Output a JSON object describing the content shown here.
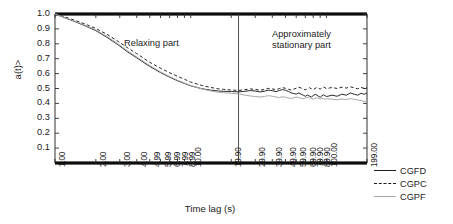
{
  "chart_data": {
    "type": "line",
    "title": "",
    "xlabel": "Time lag (s)",
    "ylabel_html": "<q<sub>a</sub>(t)>",
    "ylabel": "<qa(t)>",
    "xscale": "log",
    "xlim": [
      1.0,
      199.0
    ],
    "ylim": [
      0.0,
      1.0
    ],
    "grid": false,
    "legend_position": "right",
    "xticklabels": [
      "1.00",
      "2.00",
      "3.00",
      "4.00",
      "4.99",
      "5.99",
      "6.99",
      "7.99",
      "8.99",
      "10.00",
      "19.90",
      "29.90",
      "39.90",
      "49.90",
      "59.90",
      "69.90",
      "79.90",
      "89.90",
      "100.00",
      "199.00"
    ],
    "xtickvalues": [
      1.0,
      2.0,
      3.0,
      4.0,
      4.99,
      5.99,
      6.99,
      7.99,
      8.99,
      10.0,
      19.9,
      29.9,
      39.9,
      49.9,
      59.9,
      69.9,
      79.9,
      89.9,
      100.0,
      199.0
    ],
    "yticklabels": [
      "1.0",
      "0.9",
      "0.8",
      "0.7",
      "0.6",
      "0.5",
      "0.4",
      "0.3",
      "0.2",
      "0.1"
    ],
    "ytickvalues": [
      1.0,
      0.9,
      0.8,
      0.7,
      0.6,
      0.5,
      0.4,
      0.3,
      0.2,
      0.1
    ],
    "annotations": [
      {
        "name": "relaxing-part",
        "text": "Relaxing part",
        "x": 3.3,
        "y": 0.8
      },
      {
        "name": "stationary-part",
        "text": "Approximately\nstationary part",
        "x": 45.0,
        "y": 0.85
      }
    ],
    "divider_line": {
      "x": 22.5,
      "orientation": "vertical"
    },
    "colors": {
      "cgfd": "#1f1f1f",
      "cgpc": "#1a1a1a",
      "cgpf": "#a8a8a8",
      "axis": "#000000"
    },
    "series": [
      {
        "name": "CGFD",
        "style": "solid",
        "color": "#1f1f1f",
        "x": [
          1.0,
          1.2,
          1.45,
          1.75,
          2.0,
          2.4,
          2.9,
          3.4,
          4.0,
          4.99,
          5.99,
          6.99,
          7.99,
          8.99,
          10.0,
          12.0,
          14.0,
          16.0,
          17.5,
          19.9,
          22.5,
          25.0,
          27.5,
          29.9,
          32.5,
          35.0,
          37.5,
          39.9,
          42.5,
          45.0,
          47.5,
          49.9,
          52.5,
          55.0,
          57.5,
          59.9,
          62.5,
          65.0,
          67.5,
          69.9,
          72.5,
          75.0,
          77.5,
          79.9,
          82.5,
          85.0,
          87.5,
          89.9,
          92.5,
          95.0,
          97.5,
          100.0,
          110.0,
          120.0,
          130.0,
          140.0,
          150.0,
          160.0,
          170.0,
          180.0,
          190.0,
          199.0
        ],
        "y": [
          1.0,
          0.972,
          0.944,
          0.912,
          0.888,
          0.845,
          0.795,
          0.748,
          0.706,
          0.648,
          0.607,
          0.576,
          0.552,
          0.534,
          0.518,
          0.499,
          0.489,
          0.483,
          0.481,
          0.48,
          0.477,
          0.481,
          0.486,
          0.483,
          0.477,
          0.482,
          0.489,
          0.485,
          0.479,
          0.487,
          0.493,
          0.488,
          0.48,
          0.471,
          0.466,
          0.462,
          0.47,
          0.462,
          0.455,
          0.448,
          0.456,
          0.449,
          0.443,
          0.452,
          0.461,
          0.455,
          0.448,
          0.441,
          0.45,
          0.458,
          0.452,
          0.446,
          0.455,
          0.448,
          0.462,
          0.455,
          0.47,
          0.462,
          0.455,
          0.468,
          0.461,
          0.47
        ]
      },
      {
        "name": "CGPC",
        "style": "dashed",
        "color": "#1a1a1a",
        "x": [
          1.0,
          1.2,
          1.45,
          1.75,
          2.0,
          2.4,
          2.9,
          3.4,
          4.0,
          4.99,
          5.99,
          6.99,
          7.99,
          8.99,
          10.0,
          12.0,
          14.0,
          16.0,
          17.5,
          19.9,
          22.5,
          25.0,
          27.5,
          29.9,
          32.5,
          35.0,
          37.5,
          39.9,
          42.5,
          45.0,
          47.5,
          49.9,
          52.5,
          55.0,
          57.5,
          59.9,
          62.5,
          65.0,
          67.5,
          69.9,
          72.5,
          75.0,
          77.5,
          79.9,
          82.5,
          85.0,
          87.5,
          89.9,
          92.5,
          95.0,
          97.5,
          100.0,
          110.0,
          120.0,
          130.0,
          140.0,
          150.0,
          160.0,
          170.0,
          180.0,
          190.0,
          199.0
        ],
        "y": [
          1.0,
          0.978,
          0.953,
          0.925,
          0.903,
          0.865,
          0.818,
          0.775,
          0.734,
          0.676,
          0.636,
          0.606,
          0.582,
          0.562,
          0.543,
          0.521,
          0.507,
          0.498,
          0.494,
          0.49,
          0.487,
          0.492,
          0.497,
          0.494,
          0.488,
          0.494,
          0.501,
          0.497,
          0.492,
          0.5,
          0.506,
          0.501,
          0.495,
          0.489,
          0.496,
          0.502,
          0.509,
          0.503,
          0.497,
          0.491,
          0.499,
          0.505,
          0.498,
          0.492,
          0.5,
          0.507,
          0.502,
          0.496,
          0.503,
          0.51,
          0.505,
          0.499,
          0.507,
          0.5,
          0.509,
          0.503,
          0.511,
          0.505,
          0.498,
          0.507,
          0.501,
          0.508
        ]
      },
      {
        "name": "CGPF",
        "style": "solid",
        "color": "#a8a8a8",
        "x": [
          1.0,
          1.2,
          1.45,
          1.75,
          2.0,
          2.4,
          2.9,
          3.4,
          4.0,
          4.99,
          5.99,
          6.99,
          7.99,
          8.99,
          10.0,
          12.0,
          14.0,
          16.0,
          17.5,
          19.9,
          22.5,
          25.0,
          27.5,
          29.9,
          32.5,
          35.0,
          37.5,
          39.9,
          42.5,
          45.0,
          47.5,
          49.9,
          52.5,
          55.0,
          57.5,
          59.9,
          62.5,
          65.0,
          67.5,
          69.9,
          72.5,
          75.0,
          77.5,
          79.9,
          82.5,
          85.0,
          87.5,
          89.9,
          92.5,
          95.0,
          97.5,
          100.0,
          110.0,
          120.0,
          130.0,
          140.0,
          150.0,
          160.0,
          170.0,
          180.0,
          190.0,
          199.0
        ],
        "y": [
          1.0,
          0.973,
          0.947,
          0.916,
          0.893,
          0.851,
          0.801,
          0.754,
          0.712,
          0.654,
          0.612,
          0.58,
          0.556,
          0.537,
          0.52,
          0.498,
          0.484,
          0.475,
          0.471,
          0.468,
          0.463,
          0.456,
          0.45,
          0.446,
          0.443,
          0.447,
          0.452,
          0.448,
          0.443,
          0.439,
          0.445,
          0.441,
          0.437,
          0.433,
          0.438,
          0.443,
          0.439,
          0.435,
          0.431,
          0.436,
          0.441,
          0.437,
          0.432,
          0.428,
          0.433,
          0.438,
          0.434,
          0.43,
          0.435,
          0.431,
          0.427,
          0.432,
          0.428,
          0.424,
          0.43,
          0.426,
          0.432,
          0.428,
          0.423,
          0.418,
          0.414,
          0.41
        ]
      }
    ]
  },
  "legend": {
    "items": [
      {
        "label": "CGFD",
        "style": "solid",
        "color": "#1f1f1f"
      },
      {
        "label": "CGPC",
        "style": "dashed",
        "color": "#1a1a1a"
      },
      {
        "label": "CGPF",
        "style": "gray",
        "color": "#a8a8a8"
      }
    ]
  }
}
